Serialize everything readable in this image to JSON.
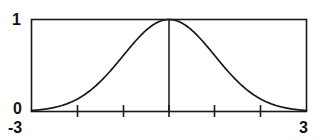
{
  "figure": {
    "background_color": "#ffffff",
    "line_color": "#1a1a1a",
    "label_color": "#111111"
  },
  "labels": {
    "y_max": "1",
    "y_min": "0",
    "x_min": "-3",
    "x_max": "3"
  },
  "chart_data": {
    "type": "line",
    "title": "",
    "xlabel": "",
    "ylabel": "",
    "xlim": [
      -3,
      3
    ],
    "ylim": [
      0,
      1
    ],
    "grid": false,
    "legend": null,
    "frame": "box",
    "xticks": [
      -2,
      -1,
      0,
      1,
      2
    ],
    "xticklabels": [
      "",
      "",
      "",
      "",
      ""
    ],
    "x_axis_end_labels": [
      "-3",
      "3"
    ],
    "yticks": [
      0,
      1
    ],
    "yticklabels": [
      "0",
      "1"
    ],
    "annotations": [
      {
        "name": "center-vertical-line",
        "type": "vline",
        "x": 0,
        "y_from": 0,
        "y_to": 1
      }
    ],
    "series": [
      {
        "name": "gaussian",
        "formula": "exp(-x^2/2)",
        "x": [
          -3,
          -2.8,
          -2.6,
          -2.4,
          -2.2,
          -2,
          -1.8,
          -1.6,
          -1.4,
          -1.2,
          -1,
          -0.8,
          -0.6,
          -0.4,
          -0.2,
          0,
          0.2,
          0.4,
          0.6,
          0.8,
          1,
          1.2,
          1.4,
          1.6,
          1.8,
          2,
          2.2,
          2.4,
          2.6,
          2.8,
          3
        ],
        "values": [
          0.011,
          0.02,
          0.034,
          0.056,
          0.089,
          0.135,
          0.198,
          0.278,
          0.375,
          0.487,
          0.607,
          0.726,
          0.835,
          0.923,
          0.98,
          1,
          0.98,
          0.923,
          0.835,
          0.726,
          0.607,
          0.487,
          0.375,
          0.278,
          0.198,
          0.135,
          0.089,
          0.056,
          0.034,
          0.02,
          0.011
        ]
      }
    ]
  }
}
